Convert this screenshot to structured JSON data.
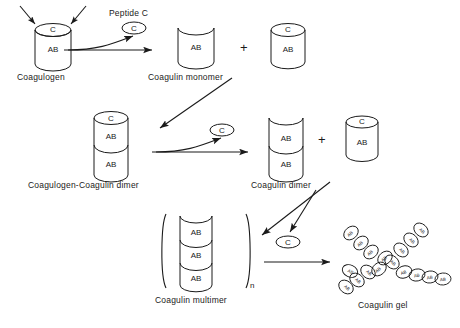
{
  "figure": {
    "background_color": "#ffffff",
    "stroke_color": "#1a1a1a"
  },
  "labels": {
    "coagulogen": "Coagulogen",
    "peptide_c": "Peptide C",
    "coagulin_monomer": "Coagulin monomer",
    "coagulogen_coagulin_dimer": "Coagulogen-Coagulin dimer",
    "coagulin_dimer": "Coagulin dimer",
    "coagulin_multimer": "Coagulin multimer",
    "coagulin_gel": "Coagulin gel"
  },
  "glyphs": {
    "c": "C",
    "ab": "AB",
    "plus": "+",
    "subscript_n": "n"
  },
  "molecules": {
    "coagulogen": {
      "cap": "C",
      "body": "AB",
      "shape": "closed-cylinder"
    },
    "coagulin_monomer": {
      "body": "AB",
      "shape": "open-cylinder"
    },
    "coagulogen_coagulin_dimer": {
      "cap": "C",
      "units": [
        "AB",
        "AB"
      ],
      "shape": "stacked-cylinder"
    },
    "coagulin_dimer": {
      "units": [
        "AB",
        "AB"
      ],
      "shape": "open-stacked-cylinder"
    },
    "coagulin_multimer": {
      "units": [
        "AB",
        "AB",
        "AB"
      ],
      "bracketed": true,
      "subscript": "n"
    },
    "peptide_c_released": {
      "label": "C",
      "shape": "ellipse"
    }
  },
  "gel_network": {
    "unit_label": "AB",
    "unit_count": 18,
    "description": "branched X-shaped chain of AB ovals"
  }
}
